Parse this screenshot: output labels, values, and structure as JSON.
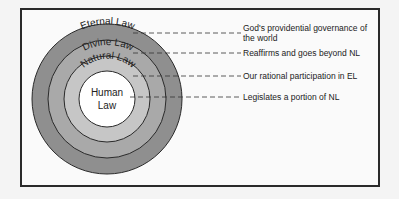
{
  "diagram": {
    "rings": [
      {
        "name": "Eternal Law",
        "color": "#8f8f8f",
        "description": "God's providential governance of the world"
      },
      {
        "name": "Divine Law",
        "color": "#a9a9a9",
        "description": "Reaffirms and goes beyond NL"
      },
      {
        "name": "Natural Law",
        "color": "#c6c6c6",
        "description": "Our rational participation in EL"
      },
      {
        "name": "Human Law",
        "color": "#ffffff",
        "description": "Legislates a portion of NL"
      }
    ],
    "center_label_line1": "Human",
    "center_label_line2": "Law",
    "desc1_line1": "God's providential governance of",
    "desc1_line2": "the world",
    "desc2": "Reaffirms and goes beyond NL",
    "desc3": "Our rational participation in EL",
    "desc4": "Legislates a portion of NL"
  }
}
